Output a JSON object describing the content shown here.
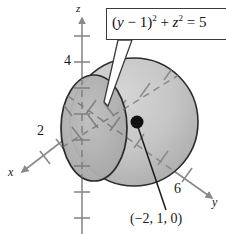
{
  "figure": {
    "part_label": ")",
    "type": "3d-coordinate-diagram"
  },
  "axes": {
    "z": {
      "label": "z",
      "direction": "up",
      "arrow": true
    },
    "x": {
      "label": "x",
      "direction": "down-left",
      "arrow": true
    },
    "y": {
      "label": "y",
      "direction": "down-right",
      "arrow": true
    }
  },
  "ticks": [
    {
      "name": "z-tick-4",
      "value": "4",
      "axis": "z"
    },
    {
      "name": "x-tick-2",
      "value": "2",
      "axis": "x"
    },
    {
      "name": "y-tick-6",
      "value": "6",
      "axis": "y"
    }
  ],
  "callout": {
    "equation_plain": "(y - 1)^2 + z^2 = 5",
    "equation_parts": {
      "open": "(",
      "var1": "y",
      "minus": " − ",
      "one": "1",
      "close": ")",
      "exp1": "2",
      "plus": " + ",
      "var2": "z",
      "exp2": "2",
      "equals": " = ",
      "result": "5"
    }
  },
  "point": {
    "label": "(−2, 1, 0)",
    "marker": "filled-dot"
  },
  "colors": {
    "sphere_fill": "#c6c6c6",
    "sphere_shade": "#b4b4b4",
    "disc_fill": "#b0b0b0",
    "outline": "#2b2b2b",
    "axis": "#8a8a8a",
    "text": "#1a1a1a",
    "callout_border": "#3a3a3a",
    "background": "#ffffff"
  }
}
